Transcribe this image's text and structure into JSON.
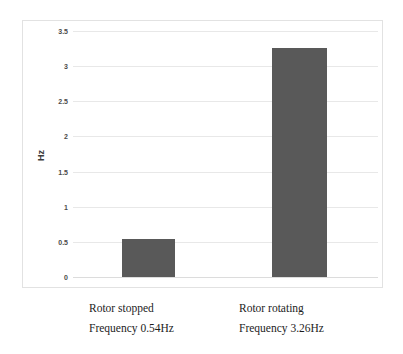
{
  "chart_data": {
    "type": "bar",
    "title": "",
    "xlabel": "",
    "ylabel": "Hz",
    "ylim": [
      0,
      3.5
    ],
    "grid": true,
    "legend": "none",
    "categories": [
      "Rotor stopped",
      "Rotor rotating"
    ],
    "values": [
      0.54,
      3.26
    ],
    "value_labels": [
      "Frequency 0.54Hz",
      "Frequency 3.26Hz"
    ],
    "yticks": [
      0,
      0.5,
      1,
      1.5,
      2,
      2.5,
      3,
      3.5
    ],
    "ytick_labels": [
      "0",
      "0.5",
      "1",
      "1.5",
      "2",
      "2.5",
      "3",
      "3.5"
    ],
    "bar_color": "#595959",
    "gridline_color": "#e8e8e8",
    "frame_color": "#e2e2e2",
    "series": [
      {
        "name": "Hz",
        "values": [
          0.54,
          3.26
        ]
      }
    ]
  },
  "captions": [
    {
      "title": "Rotor stopped",
      "detail": "Frequency 0.54Hz"
    },
    {
      "title": "Rotor rotating",
      "detail": "Frequency 3.26Hz"
    }
  ],
  "axis": {
    "y_title": "Hz"
  }
}
